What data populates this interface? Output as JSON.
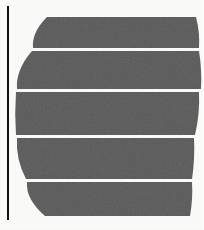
{
  "image": {
    "kind": "scanned-page-photograph",
    "title": "Scanned page with dark horizontal bands",
    "width": 204,
    "height": 230,
    "background_color": "#fbfbfa",
    "ink_color": "#5a5a5a",
    "rule_color": "#121212",
    "separator_color": "#fbfbfa"
  },
  "vertical_rule": {
    "label": "page spine rule",
    "color": "#121212",
    "x": 7,
    "y": 6,
    "width": 2,
    "height": 214
  },
  "bands": [
    {
      "index": 1,
      "label": "band-1",
      "top": 17,
      "bottom": 48,
      "left_top_x": 47,
      "left_bottom_x": 33,
      "right_top_x": 196,
      "right_bottom_x": 199,
      "fill": "#5a5a5a"
    },
    {
      "index": 2,
      "label": "band-2",
      "top": 51,
      "bottom": 89,
      "left_top_x": 32,
      "left_bottom_x": 17,
      "right_top_x": 199,
      "right_bottom_x": 201,
      "fill": "#5a5a5a"
    },
    {
      "index": 3,
      "label": "band-3",
      "top": 92,
      "bottom": 135,
      "left_top_x": 16,
      "left_bottom_x": 16,
      "right_top_x": 199,
      "right_bottom_x": 195,
      "fill": "#5a5a5a"
    },
    {
      "index": 4,
      "label": "band-4",
      "top": 138,
      "bottom": 179,
      "left_top_x": 17,
      "left_bottom_x": 26,
      "right_top_x": 194,
      "right_bottom_x": 192,
      "fill": "#5a5a5a"
    },
    {
      "index": 5,
      "label": "band-5",
      "top": 182,
      "bottom": 216,
      "left_top_x": 27,
      "left_bottom_x": 45,
      "right_top_x": 192,
      "right_bottom_x": 190,
      "fill": "#5a5a5a"
    }
  ],
  "separators": [
    {
      "label": "separator-1",
      "y": 49,
      "thickness": 2
    },
    {
      "label": "separator-2",
      "y": 90,
      "thickness": 2
    },
    {
      "label": "separator-3",
      "y": 136,
      "thickness": 2
    },
    {
      "label": "separator-4",
      "y": 180,
      "thickness": 2
    }
  ]
}
